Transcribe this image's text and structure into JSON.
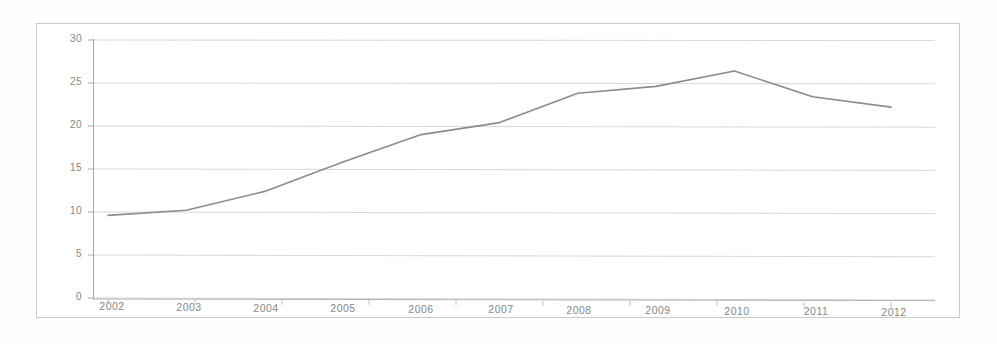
{
  "chart_data": {
    "type": "line",
    "title": "",
    "subtitle": "",
    "xlabel": "",
    "ylabel": "",
    "categories": [
      "2002",
      "2003",
      "2004",
      "2005",
      "2006",
      "2007",
      "2008",
      "2009",
      "2010",
      "2011",
      "2012"
    ],
    "x": [
      2002,
      2003,
      2004,
      2005,
      2006,
      2007,
      2008,
      2009,
      2010,
      2011,
      2012
    ],
    "values": [
      9.6,
      10.2,
      12.4,
      15.8,
      19.0,
      20.4,
      23.8,
      24.6,
      26.4,
      23.4,
      22.2
    ],
    "series": [
      {
        "name": "series-1",
        "values": [
          9.6,
          10.2,
          12.4,
          15.8,
          19.0,
          20.4,
          23.8,
          24.6,
          26.4,
          23.4,
          22.2
        ],
        "color": "#8c8c8e"
      }
    ],
    "ylim": [
      0,
      30
    ],
    "yticks": [
      0,
      5,
      10,
      15,
      20,
      25,
      30
    ],
    "ytick_labels": [
      "0",
      "5",
      "10",
      "15",
      "20",
      "25",
      "30"
    ],
    "xtick_labels": [
      "2002",
      "2003",
      "2004",
      "2005",
      "2006",
      "2007",
      "2008",
      "2009",
      "2010",
      "2011",
      "2012"
    ],
    "grid": true,
    "grid_axis": "y",
    "legend": false,
    "legend_position": "none",
    "markers": false,
    "annotations": []
  },
  "style": {
    "line_color": "#8c8c8e",
    "grid_color": "#cfcfcf",
    "axis_color": "#a8a8aa",
    "tick_text_color": "#86868a",
    "frame_color": "#c9c9c7",
    "background": "#ffffff"
  }
}
